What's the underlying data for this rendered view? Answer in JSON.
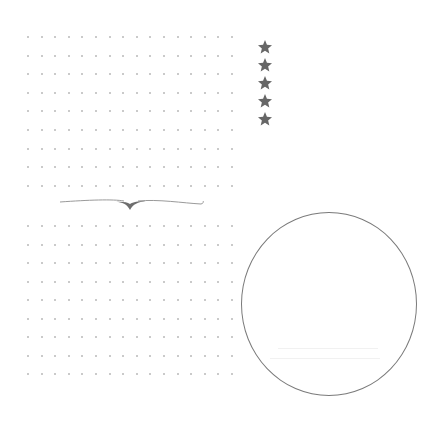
{
  "page": {
    "background": "#ffffff"
  },
  "dot_grids": [
    {
      "name": "upper-dot-grid",
      "x0": 28,
      "y0": 37,
      "cols": 16,
      "rows": 9,
      "dx": 13.6,
      "dy": 18.6,
      "dot_color": "#b9b9b9"
    },
    {
      "name": "lower-dot-grid",
      "x0": 28,
      "y0": 226,
      "cols": 16,
      "rows": 9,
      "dx": 13.6,
      "dy": 18.5,
      "dot_color": "#b9b9b9"
    }
  ],
  "rating": {
    "icon": "star-icon",
    "count": 5,
    "color": "#666666"
  },
  "divider": {
    "icon": "ornamental-swash-divider",
    "color": "#8a8a8a"
  },
  "circle": {
    "shape": "circle-outline",
    "stroke_color": "#7a7a7a",
    "faint_lines": 2
  }
}
